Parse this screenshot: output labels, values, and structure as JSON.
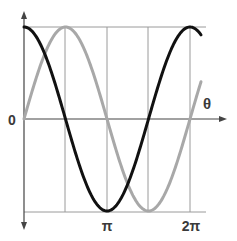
{
  "chart_data": {
    "type": "line",
    "title": "",
    "xlabel": "θ",
    "ylabel": "",
    "x_tick_labels": [
      "π",
      "2π"
    ],
    "x_tick_positions_rad": [
      3.14159,
      6.28319
    ],
    "y_tick_labels": [
      "0"
    ],
    "xlim": [
      0,
      6.7
    ],
    "ylim": [
      -1,
      1
    ],
    "grid": true,
    "gridlines_x_rad": [
      1.5708,
      3.14159,
      4.71239,
      6.28319
    ],
    "gridlines_y": [
      1,
      -1
    ],
    "legend": null,
    "series": [
      {
        "name": "cos θ",
        "color": "#111111",
        "function": "cos",
        "x": [
          0,
          0.785,
          1.571,
          2.356,
          3.142,
          3.927,
          4.712,
          5.498,
          6.283,
          6.7
        ],
        "values": [
          1,
          0.707,
          0,
          -0.707,
          -1,
          -0.707,
          0,
          0.707,
          1,
          0.914
        ]
      },
      {
        "name": "sin θ",
        "color": "#a8a8a8",
        "function": "sin",
        "x": [
          0,
          0.785,
          1.571,
          2.356,
          3.142,
          3.927,
          4.712,
          5.498,
          6.283,
          6.7
        ],
        "values": [
          0,
          0.707,
          1,
          0.707,
          0,
          -0.707,
          -1,
          -0.707,
          0,
          0.407
        ]
      }
    ]
  },
  "labels": {
    "origin": "0",
    "x_axis": "θ",
    "pi": "π",
    "two_pi": "2π"
  },
  "colors": {
    "axis": "#444444",
    "grid": "#9a9a9a",
    "cos_curve": "#111111",
    "sin_curve": "#a8a8a8",
    "text": "#3a3a3a"
  }
}
